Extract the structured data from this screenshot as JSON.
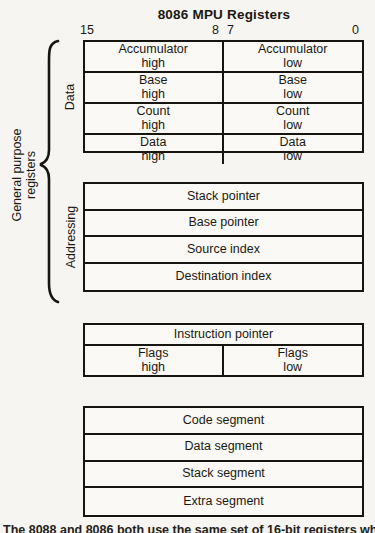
{
  "title": "8086 MPU Registers",
  "bit_labels": {
    "b15": "15",
    "b8": "8",
    "b7": "7",
    "b0": "0"
  },
  "brace_label": "General purpose\nregisters",
  "group_labels": {
    "data": "Data",
    "addressing": "Addressing"
  },
  "registers": {
    "data_rows": [
      {
        "high": "Accumulator\nhigh",
        "low": "Accumulator\nlow"
      },
      {
        "high": "Base\nhigh",
        "low": "Base\nlow"
      },
      {
        "high": "Count\nhigh",
        "low": "Count\nlow"
      },
      {
        "high": "Data\nhigh",
        "low": "Data\nlow"
      }
    ],
    "addressing_rows": [
      "Stack pointer",
      "Base pointer",
      "Source index",
      "Destination index"
    ],
    "pointer_flags": {
      "instruction": "Instruction pointer",
      "flags_high": "Flags\nhigh",
      "flags_low": "Flags\nlow"
    },
    "segment_rows": [
      "Code segment",
      "Data segment",
      "Stack segment",
      "Extra segment"
    ]
  },
  "caption": "The 8088 and 8086 both use the same set of 16-bit registers when their registers",
  "colors": {
    "ink": "#181510",
    "paper": "#f6f5f1"
  }
}
